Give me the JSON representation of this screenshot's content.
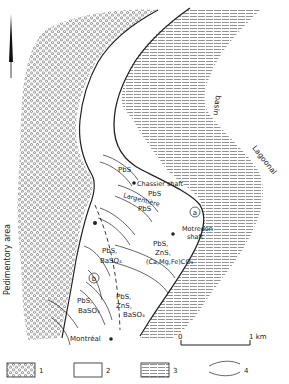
{
  "map": {
    "labels": {
      "pedimentory_area": "Pedimentory area",
      "basin": "basin",
      "lagoonal": "Lagoonal",
      "chassier_shaft": "Chassier shaft",
      "largentiere": "Largentière",
      "motredon_shaft_line1": "Motredon",
      "motredon_shaft_line2": "shaft",
      "montreal": "Montréal",
      "zone_a": "a",
      "zone_b": "b"
    },
    "mineral_labels": {
      "pbs_top": "PbS",
      "pbs_mid": "PbS",
      "pbs_low": "PbS",
      "a_line1": "PbS,",
      "a_line2": "ZnS,",
      "a_line3": "(Ca,Mg,Fe)CO₃",
      "b_upper_line1": "PbS,",
      "b_upper_line2": "BaSO₄",
      "b_left_line1": "PbS,",
      "b_left_line2": "BaSO₄",
      "b_right_line1": "PbS,",
      "b_right_line2": "ZnS,",
      "b_right_line3": "BaSO₄"
    },
    "scale_bar": {
      "start": "0",
      "end": "1 km"
    },
    "north_arrow": "north-arrow"
  },
  "legend": {
    "items": [
      {
        "number": "1",
        "pattern": "circles"
      },
      {
        "number": "2",
        "pattern": "blank"
      },
      {
        "number": "3",
        "pattern": "dashes"
      },
      {
        "number": "4",
        "pattern": "curved-lines"
      }
    ]
  },
  "colors": {
    "ink": "#222222",
    "paper": "#ffffff",
    "pattern": "#555555"
  }
}
